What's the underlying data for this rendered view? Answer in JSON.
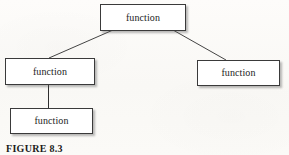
{
  "figure": {
    "caption": "FIGURE 8.3",
    "background_color": "#fbfaf8",
    "box_fill_color": "#ffffff",
    "box_border_color": "#3a3a3a",
    "shadow_color": "#5a5a5a",
    "line_color": "#2f2f2f"
  },
  "nodes": {
    "root": {
      "label": "function"
    },
    "left": {
      "label": "function"
    },
    "right": {
      "label": "function"
    },
    "left_child": {
      "label": "function"
    }
  },
  "connectors": [
    {
      "name": "root-to-left",
      "from": "root",
      "to": "left",
      "style": "diagonal"
    },
    {
      "name": "root-to-right",
      "from": "root",
      "to": "right",
      "style": "diagonal"
    },
    {
      "name": "left-to-left-child",
      "from": "left",
      "to": "left_child",
      "style": "vertical"
    }
  ]
}
